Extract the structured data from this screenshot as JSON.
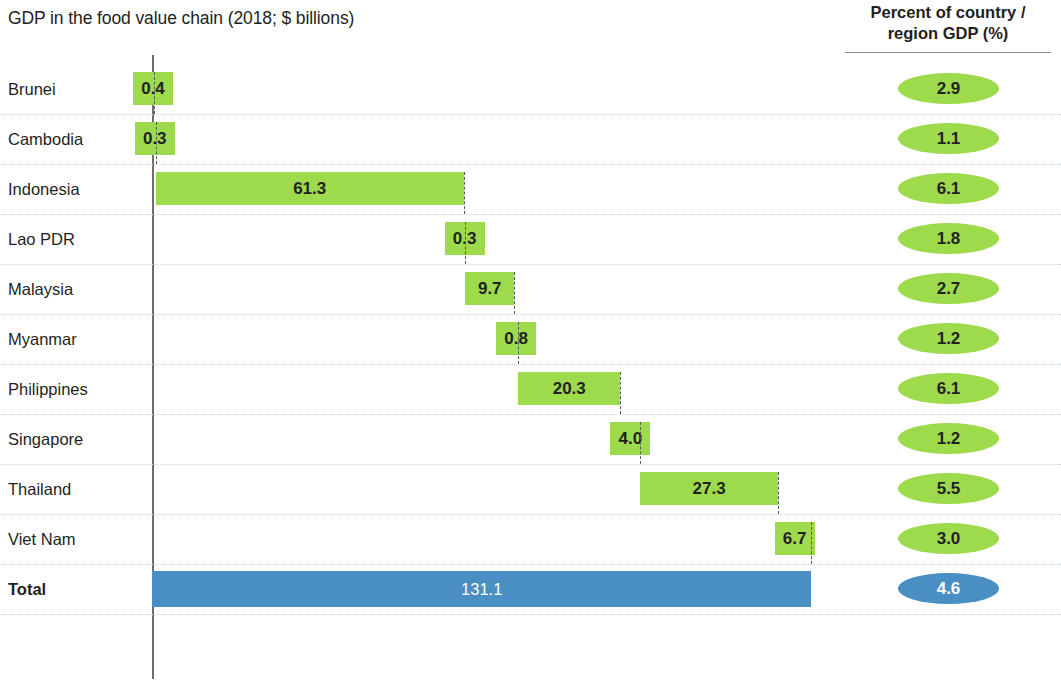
{
  "header": {
    "chart_title": "GDP in the food value chain (2018; $ billions)",
    "percent_header_line1": "Percent of country /",
    "percent_header_line2": "region GDP (%)"
  },
  "colors": {
    "bar_green": "#9ddb4d",
    "bar_blue": "#4a8fc4",
    "gridline": "#c9d6e2",
    "axis": "#6f6f6f",
    "text": "#231f20",
    "total_text": "#ffffff"
  },
  "chart_data": {
    "type": "bar",
    "chart_subtype": "waterfall",
    "title": "GDP in the food value chain (2018; $ billions)",
    "xlabel": "",
    "ylabel": "",
    "orientation": "horizontal",
    "value_unit": "$ billions",
    "xlim": [
      0,
      131.1
    ],
    "grid": true,
    "legend": false,
    "categories": [
      "Brunei",
      "Cambodia",
      "Indonesia",
      "Lao PDR",
      "Malaysia",
      "Myanmar",
      "Philippines",
      "Singapore",
      "Thailand",
      "Viet Nam",
      "Total"
    ],
    "values": [
      0.4,
      0.3,
      61.3,
      0.3,
      9.7,
      0.8,
      20.3,
      4.0,
      27.3,
      6.7,
      131.1
    ],
    "value_labels": [
      "0.4",
      "0.3",
      "61.3",
      "0.3",
      "9.7",
      "0.8",
      "20.3",
      "4.0",
      "27.3",
      "6.7",
      "131.1"
    ],
    "cumulative_start": [
      0.0,
      0.4,
      0.7,
      62.0,
      62.3,
      72.0,
      72.8,
      93.1,
      97.1,
      124.4,
      0.0
    ],
    "cumulative_end": [
      0.4,
      0.7,
      62.0,
      62.3,
      72.0,
      72.8,
      93.1,
      97.1,
      124.4,
      131.1,
      131.1
    ],
    "percent_series_name": "Percent of country / region GDP (%)",
    "percent_values": [
      2.9,
      1.1,
      6.1,
      1.8,
      2.7,
      1.2,
      6.1,
      1.2,
      5.5,
      3.0,
      4.6
    ],
    "percent_labels": [
      "2.9",
      "1.1",
      "6.1",
      "1.8",
      "2.7",
      "1.2",
      "6.1",
      "1.2",
      "5.5",
      "3.0",
      "4.6"
    ]
  },
  "rows": [
    {
      "label": "Brunei",
      "value_label": "0.4",
      "percent_label": "2.9"
    },
    {
      "label": "Cambodia",
      "value_label": "0.3",
      "percent_label": "1.1"
    },
    {
      "label": "Indonesia",
      "value_label": "61.3",
      "percent_label": "6.1"
    },
    {
      "label": "Lao PDR",
      "value_label": "0.3",
      "percent_label": "1.8"
    },
    {
      "label": "Malaysia",
      "value_label": "9.7",
      "percent_label": "2.7"
    },
    {
      "label": "Myanmar",
      "value_label": "0.8",
      "percent_label": "1.2"
    },
    {
      "label": "Philippines",
      "value_label": "20.3",
      "percent_label": "6.1"
    },
    {
      "label": "Singapore",
      "value_label": "4.0",
      "percent_label": "1.2"
    },
    {
      "label": "Thailand",
      "value_label": "27.3",
      "percent_label": "5.5"
    },
    {
      "label": "Viet Nam",
      "value_label": "6.7",
      "percent_label": "3.0"
    },
    {
      "label": "Total",
      "value_label": "131.1",
      "percent_label": "4.6"
    }
  ]
}
